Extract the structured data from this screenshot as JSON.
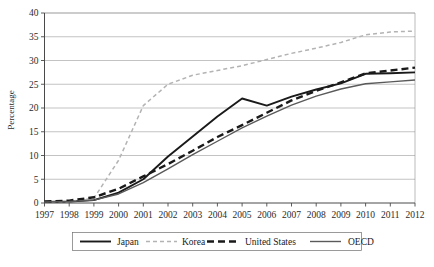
{
  "chart_data": {
    "type": "line",
    "title": "",
    "subtitle": "",
    "xlabel": "",
    "ylabel": "Percentage",
    "x": [
      1997,
      1998,
      1999,
      2000,
      2001,
      2002,
      2003,
      2004,
      2005,
      2006,
      2007,
      2008,
      2009,
      2010,
      2011,
      2012
    ],
    "xtick_labels": [
      "1997",
      "1998",
      "1999",
      "2000",
      "2001",
      "2002",
      "2003",
      "2004",
      "2005",
      "2006",
      "2007",
      "2008",
      "2009",
      "2010",
      "2011",
      "2012"
    ],
    "ytick_labels": [
      "0",
      "5",
      "10",
      "15",
      "20",
      "25",
      "30",
      "35",
      "40"
    ],
    "yticks": [
      0,
      5,
      10,
      15,
      20,
      25,
      30,
      35,
      40
    ],
    "ylim": [
      0,
      40
    ],
    "xlim": [
      1997,
      2012
    ],
    "grid": "horizontal",
    "legend_position": "bottom",
    "series": [
      {
        "name": "Japan",
        "style": "solid",
        "color": "#1a1a1a",
        "width": 1.9,
        "values": [
          0.2,
          0.3,
          0.6,
          2.2,
          5.0,
          9.8,
          14.0,
          18.2,
          22.0,
          20.5,
          22.4,
          23.9,
          25.2,
          27.2,
          27.3,
          27.5
        ]
      },
      {
        "name": "Korea",
        "style": "dashed-light",
        "color": "#b3b3b3",
        "width": 1.5,
        "values": [
          0.2,
          0.3,
          1.0,
          9.0,
          20.5,
          25.0,
          26.9,
          27.9,
          28.9,
          30.2,
          31.5,
          32.6,
          33.8,
          35.4,
          36.0,
          36.2
        ]
      },
      {
        "name": "United States",
        "style": "dashed-bold",
        "color": "#1a1a1a",
        "width": 2.4,
        "values": [
          0.3,
          0.5,
          1.2,
          3.0,
          5.6,
          8.2,
          11.0,
          13.9,
          16.4,
          19.0,
          21.6,
          23.6,
          25.4,
          27.3,
          27.9,
          28.5
        ]
      },
      {
        "name": "OECD",
        "style": "solid",
        "color": "#5a5a5a",
        "width": 1.4,
        "values": [
          0.2,
          0.3,
          0.6,
          1.9,
          4.3,
          7.2,
          10.2,
          13.0,
          15.8,
          18.3,
          20.6,
          22.5,
          24.0,
          25.1,
          25.5,
          25.9
        ]
      }
    ]
  },
  "axis": {
    "y_title": "Percentage"
  },
  "legend": {
    "entries": [
      {
        "label": "Japan"
      },
      {
        "label": "Korea"
      },
      {
        "label": "United States"
      },
      {
        "label": "OECD"
      }
    ]
  }
}
